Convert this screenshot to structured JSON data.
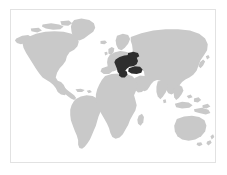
{
  "figure": {
    "kind": "locator-map",
    "projection": "equirectangular",
    "frame": {
      "border_color": "#e2e2e2",
      "background_color": "#ffffff",
      "x": 10,
      "y": 9,
      "width": 206,
      "height": 154
    },
    "canvas_background": "#ffffff"
  },
  "legend": {
    "land_color": "#c9c9c9",
    "ocean_color": "#ffffff",
    "highlight_color": "#2e2e2e",
    "land_label": "Land",
    "ocean_label": "Ocean",
    "highlight_label": "Highlighted region"
  },
  "map": {
    "title": "World map with highlighted region",
    "highlight_region_name": "Balkan Peninsula / Southeast Europe",
    "highlight_continent": "Europe",
    "landmasses": [
      {
        "name": "North America"
      },
      {
        "name": "Greenland"
      },
      {
        "name": "South America"
      },
      {
        "name": "Europe"
      },
      {
        "name": "Africa"
      },
      {
        "name": "Asia"
      },
      {
        "name": "Australia"
      },
      {
        "name": "New Zealand"
      },
      {
        "name": "Madagascar"
      },
      {
        "name": "Japan"
      },
      {
        "name": "British Isles"
      },
      {
        "name": "Indonesia"
      }
    ],
    "highlighted_areas": [
      {
        "name": "Former Yugoslavia"
      },
      {
        "name": "Greece"
      },
      {
        "name": "Bulgaria"
      },
      {
        "name": "Romania"
      },
      {
        "name": "Turkey (western)"
      }
    ]
  }
}
